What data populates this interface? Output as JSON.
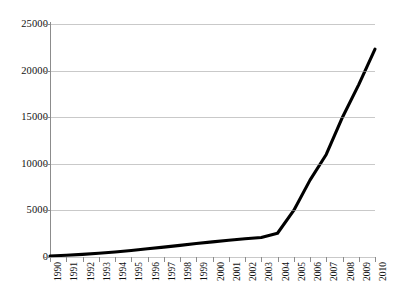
{
  "chart_data": {
    "type": "line",
    "title": "",
    "subtitle": "",
    "xlabel": "",
    "ylabel": "",
    "categories": [
      "1990",
      "1991",
      "1992",
      "1993",
      "1994",
      "1995",
      "1996",
      "1997",
      "1998",
      "1999",
      "2000",
      "2001",
      "2002",
      "2003",
      "2004",
      "2005",
      "2006",
      "2007",
      "2008",
      "2009",
      "2010"
    ],
    "series": [
      {
        "name": "",
        "color": "#000000",
        "values": [
          100,
          180,
          280,
          400,
          540,
          700,
          880,
          1060,
          1250,
          1440,
          1620,
          1800,
          1950,
          2100,
          2550,
          5000,
          8250,
          11000,
          15000,
          18500,
          22300
        ]
      }
    ],
    "ylim": [
      0,
      25000
    ],
    "yticks": [
      0,
      5000,
      10000,
      15000,
      20000,
      25000
    ],
    "ytick_labels": [
      "0",
      "5000",
      "10000",
      "15000",
      "20000",
      "25000"
    ],
    "grid": true,
    "grid_axis": "y",
    "legend": false,
    "legend_position": "none",
    "background": "#ffffff",
    "gridline_color": "#a6a6a6",
    "axis_color": "#8c8c8c",
    "marker": "none"
  }
}
